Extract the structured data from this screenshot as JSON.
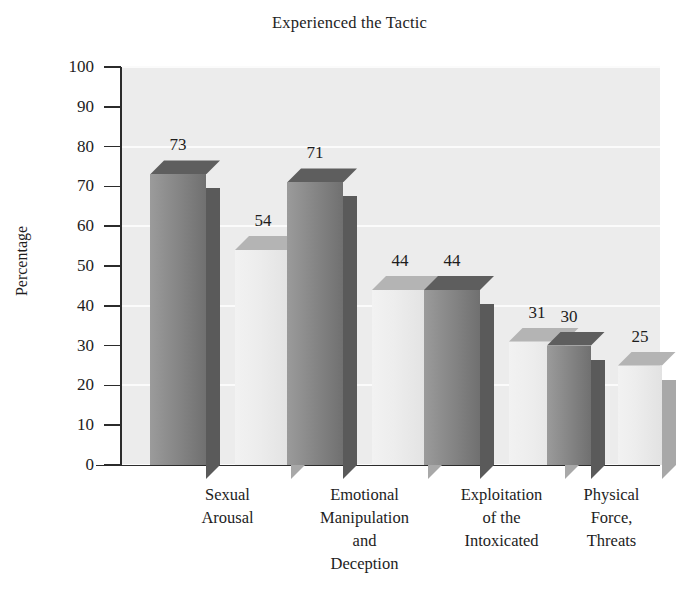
{
  "chart_data": {
    "type": "bar",
    "title": "Experienced the Tactic",
    "xlabel": "",
    "ylabel": "Percentage",
    "ylim": [
      0,
      100
    ],
    "ytick_step": 10,
    "yticks": [
      100,
      90,
      80,
      70,
      60,
      50,
      40,
      30,
      20,
      10,
      0
    ],
    "grid": true,
    "grid_orientation": "horizontal",
    "legend": null,
    "categories": [
      [
        "Sexual",
        "Arousal"
      ],
      [
        "Emotional",
        "Manipulation",
        "and",
        "Deception"
      ],
      [
        "Exploitation",
        "of the",
        "Intoxicated"
      ],
      [
        "Physical",
        "Force,",
        "Threats"
      ]
    ],
    "series": [
      {
        "name": "series-1",
        "values": [
          73,
          71,
          44,
          30
        ],
        "color": "#8a8a8a"
      },
      {
        "name": "series-2",
        "values": [
          54,
          44,
          31,
          25
        ],
        "color": "#ededed"
      }
    ],
    "bars": [
      {
        "category": 0,
        "series": 0,
        "value": 73,
        "label": "73",
        "style": "dark",
        "x": 150,
        "width": 56
      },
      {
        "category": 0,
        "series": 1,
        "value": 54,
        "label": "54",
        "style": "light",
        "x": 235,
        "width": 56
      },
      {
        "category": 1,
        "series": 0,
        "value": 71,
        "label": "71",
        "style": "dark",
        "x": 287,
        "width": 56
      },
      {
        "category": 1,
        "series": 1,
        "value": 44,
        "label": "44",
        "style": "light",
        "x": 372,
        "width": 56
      },
      {
        "category": 2,
        "series": 0,
        "value": 44,
        "label": "44",
        "style": "dark",
        "x": 424,
        "width": 56
      },
      {
        "category": 2,
        "series": 1,
        "value": 31,
        "label": "31",
        "style": "light",
        "x": 509,
        "width": 56
      },
      {
        "category": 3,
        "series": 0,
        "value": 30,
        "label": "30",
        "style": "dark",
        "x": 547,
        "width": 44
      },
      {
        "category": 3,
        "series": 1,
        "value": 25,
        "label": "25",
        "style": "light",
        "x": 618,
        "width": 44
      }
    ],
    "gridline_values": [
      100,
      80,
      60,
      40,
      20,
      0
    ],
    "colors": {
      "plot_background": "#ececec",
      "gridline": "#fbfbfb",
      "axis": "#2b2b2b",
      "text": "#1d1d1d",
      "page_background": "#ffffff"
    }
  }
}
